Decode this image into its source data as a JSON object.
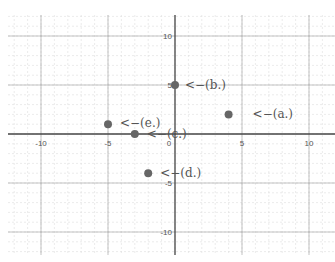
{
  "chart_data": {
    "type": "scatter",
    "title": "",
    "xlabel": "",
    "ylabel": "",
    "xlim": [
      -12.5,
      12
    ],
    "ylim": [
      -13,
      12
    ],
    "grid": true,
    "x_ticks": [
      -10,
      -5,
      0,
      5,
      10
    ],
    "y_ticks": [
      10,
      5,
      -5,
      -10
    ],
    "x_tick_labels": [
      "-10",
      "-5",
      "0",
      "5",
      "10"
    ],
    "y_tick_labels": [
      "10",
      "5",
      "-5",
      "-10"
    ],
    "points": [
      {
        "label": "(a.)",
        "annotation": "<−(a.)",
        "x": 4,
        "y": 2
      },
      {
        "label": "(b.)",
        "annotation": "<−(b.)",
        "x": 0,
        "y": 5
      },
      {
        "label": "(c.)",
        "annotation": "<−(c.)",
        "x": -3,
        "y": 0
      },
      {
        "label": "(d.)",
        "annotation": "<−(d.)",
        "x": -2,
        "y": -4
      },
      {
        "label": "(e.)",
        "annotation": "<−(e.)",
        "x": -5,
        "y": 1
      }
    ],
    "colors": {
      "point": "#666666",
      "axis": "#444444",
      "major_grid": "#9a9a9a",
      "minor_grid": "#dddddd",
      "text": "#555555"
    }
  }
}
